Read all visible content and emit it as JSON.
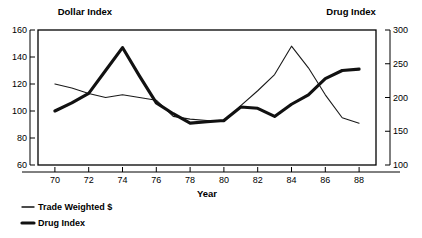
{
  "chart_data": {
    "type": "line",
    "title": "",
    "xlabel": "Year",
    "x": [
      70,
      71,
      72,
      73,
      74,
      75,
      76,
      77,
      78,
      79,
      80,
      81,
      82,
      83,
      84,
      85,
      86,
      87,
      88
    ],
    "left_axis": {
      "name": "Dollar Index",
      "ticks": [
        60,
        80,
        100,
        120,
        140,
        160
      ],
      "ylim": [
        60,
        160
      ]
    },
    "right_axis": {
      "name": "Drug Index",
      "ticks": [
        100,
        150,
        200,
        250,
        300
      ],
      "ylim": [
        100,
        300
      ]
    },
    "xlim": [
      69,
      89
    ],
    "xticks": [
      70,
      72,
      74,
      76,
      78,
      80,
      82,
      84,
      86,
      88
    ],
    "grid": false,
    "legend_position": "bottom-left",
    "series": [
      {
        "name": "Trade Weighted $",
        "axis": "left",
        "style": "thin",
        "color": "#1a1a1a",
        "values": [
          120,
          117,
          113,
          110,
          112,
          110,
          108,
          96,
          94,
          93,
          92,
          104,
          115,
          127,
          148,
          132,
          112,
          95,
          91
        ]
      },
      {
        "name": "Drug Index",
        "axis": "right",
        "style": "thick",
        "color": "#111111",
        "values_left_scale": [
          100,
          106,
          113,
          130,
          147,
          126,
          106,
          98,
          91,
          92,
          93,
          103,
          102,
          96,
          105,
          112,
          124,
          130,
          131
        ],
        "values": [
          180,
          192,
          206,
          240,
          274,
          232,
          192,
          176,
          162,
          164,
          166,
          186,
          184,
          172,
          190,
          204,
          228,
          240,
          242
        ]
      }
    ]
  },
  "legend": {
    "items": [
      {
        "label": "Trade Weighted $",
        "style": "thin"
      },
      {
        "label": "Drug Index",
        "style": "thick"
      }
    ]
  }
}
